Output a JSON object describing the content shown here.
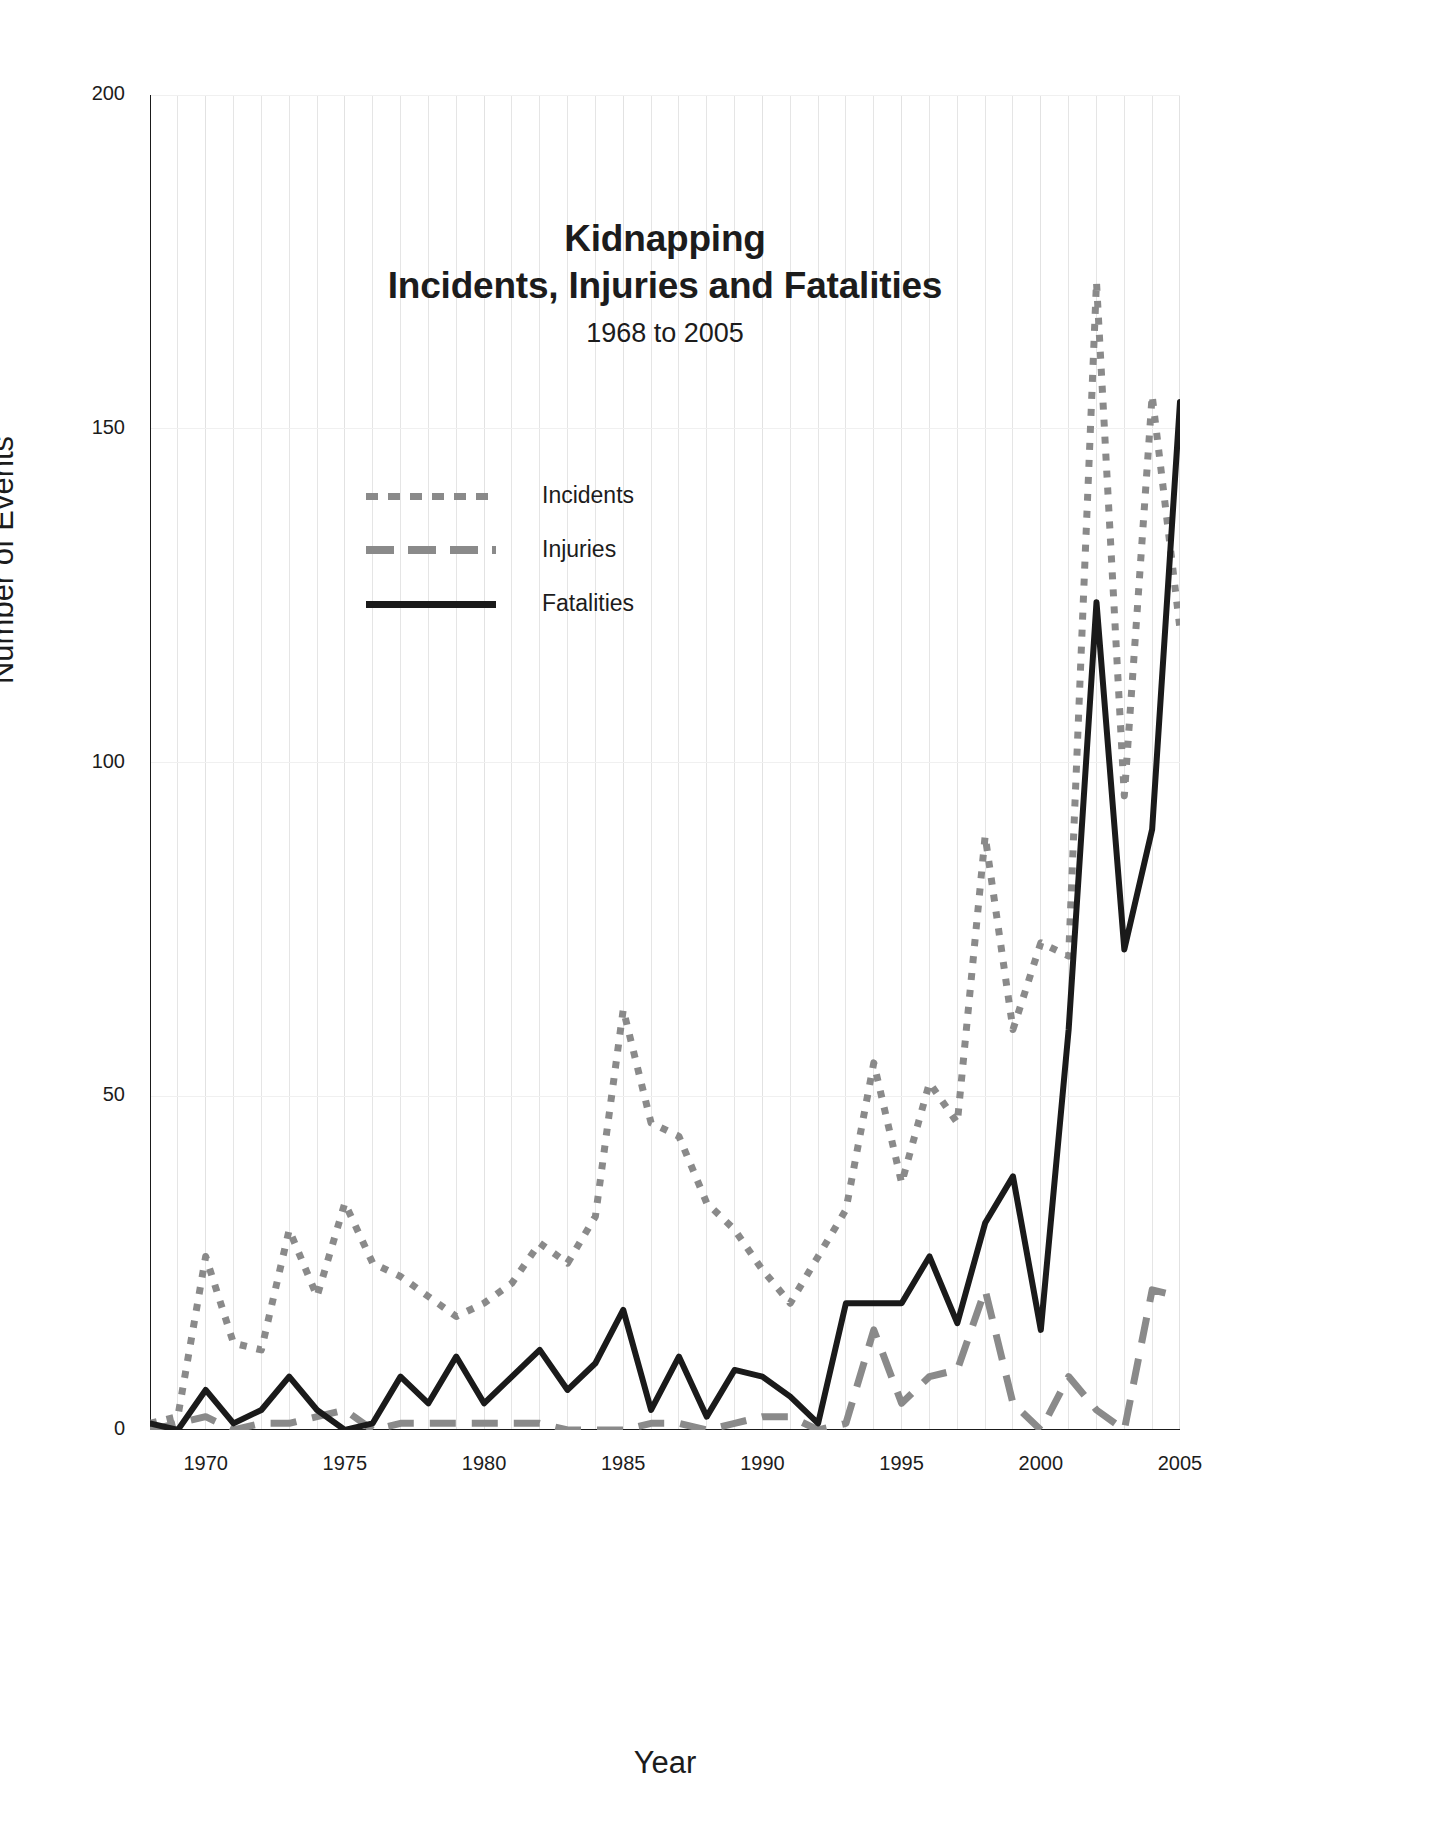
{
  "chart_data": {
    "type": "line",
    "title": "Kidnapping",
    "title_line2": "Incidents, Injuries and Fatalities",
    "subtitle": "1968 to 2005",
    "xlabel": "Year",
    "ylabel": "Number of Events",
    "xlim": [
      1968,
      2005
    ],
    "ylim": [
      0,
      200
    ],
    "ytick_labels": [
      "0",
      "50",
      "100",
      "150",
      "200"
    ],
    "ytick_values": [
      0,
      50,
      100,
      150,
      200
    ],
    "ytick_minor_step": 5,
    "xtick_labels": [
      "1970",
      "1975",
      "1980",
      "1985",
      "1990",
      "1995",
      "2000",
      "2005"
    ],
    "xtick_values": [
      1970,
      1975,
      1980,
      1985,
      1990,
      1995,
      2000,
      2005
    ],
    "grid": "vertical gridlines every year, light gray; faint horizontal gridlines at major y ticks",
    "legend_position": "inside upper-left of plot",
    "x": [
      1968,
      1969,
      1970,
      1971,
      1972,
      1973,
      1974,
      1975,
      1976,
      1977,
      1978,
      1979,
      1980,
      1981,
      1982,
      1983,
      1984,
      1985,
      1986,
      1987,
      1988,
      1989,
      1990,
      1991,
      1992,
      1993,
      1994,
      1995,
      1996,
      1997,
      1998,
      1999,
      2000,
      2001,
      2002,
      2003,
      2004,
      2005
    ],
    "series": [
      {
        "name": "Incidents",
        "style": "dotted",
        "color": "#8a8a8a",
        "values": [
          1,
          2,
          26,
          13,
          12,
          30,
          20,
          34,
          25,
          23,
          20,
          17,
          19,
          22,
          28,
          25,
          32,
          63,
          46,
          44,
          34,
          30,
          24,
          19,
          26,
          33,
          55,
          37,
          52,
          46,
          89,
          60,
          73,
          71,
          172,
          95,
          155,
          120
        ]
      },
      {
        "name": "Injuries",
        "style": "dashed",
        "color": "#8a8a8a",
        "values": [
          0,
          1,
          2,
          0,
          1,
          1,
          2,
          3,
          0,
          1,
          1,
          1,
          1,
          1,
          1,
          0,
          0,
          0,
          1,
          1,
          0,
          1,
          2,
          2,
          0,
          1,
          15,
          4,
          8,
          9,
          21,
          4,
          0,
          8,
          3,
          0,
          21,
          20
        ]
      },
      {
        "name": "Fatalities",
        "style": "solid",
        "color": "#1a1a1a",
        "values": [
          1,
          0,
          6,
          1,
          3,
          8,
          3,
          0,
          1,
          8,
          4,
          11,
          4,
          8,
          12,
          6,
          10,
          18,
          3,
          11,
          2,
          9,
          8,
          5,
          1,
          19,
          19,
          19,
          26,
          16,
          31,
          38,
          15,
          60,
          124,
          72,
          90,
          154
        ]
      }
    ]
  },
  "legend": {
    "items": [
      {
        "label": "Incidents",
        "key": "dotted"
      },
      {
        "label": "Injuries",
        "key": "dashed"
      },
      {
        "label": "Fatalities",
        "key": "solid"
      }
    ]
  },
  "colors": {
    "gray_series": "#8a8a8a",
    "dark_series": "#1a1a1a",
    "grid": "#e2e2e2",
    "axis": "#1a1a1a",
    "text": "#1c1c1c"
  }
}
